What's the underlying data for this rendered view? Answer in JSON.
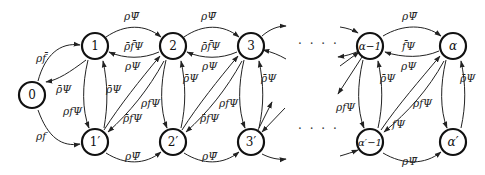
{
  "diagram": {
    "type": "state-transition",
    "nodes": {
      "n0": "0",
      "n1": "1",
      "n2": "2",
      "n3": "3",
      "nam1": "α−1",
      "na": "α",
      "n1p": "1′",
      "n2p": "2′",
      "n3p": "3′",
      "nam1p": "α′−1",
      "nap": "α′"
    },
    "ellipsis": "· · · ·",
    "labels": {
      "l0_1": "ρf̄",
      "l1_0": "ρ̄Ψ",
      "l0_1p": "ρf",
      "l1_1p": "ρfΨ",
      "l1p_1": "ρ̄Ψ",
      "l1_2": "ρΨ̄",
      "l2_1": "ρ̄f̄Ψ",
      "l1p_2": "ρΨ",
      "l2_1p": "ρ̄fΨ",
      "l1p_2p": "ρΨ̄",
      "l2_2p": "ρfΨ",
      "l2p_2": "ρ̄Ψ",
      "l2_3": "ρΨ̄",
      "l3_2": "ρ̄f̄Ψ",
      "l2p_3": "ρΨ",
      "l3_2p": "ρ̄fΨ",
      "l2p_3p": "ρΨ̄",
      "l3_3p": "ρfΨ",
      "l3p_3": "ρ̄Ψ",
      "lam1_a": "ρΨ̄",
      "la_am1": "f̄Ψ",
      "lam1p_a": "ρΨ",
      "la_am1p": "fΨ",
      "lam1p_ap": "ρΨ̄",
      "lam1_am1p": "ρfΨ",
      "lam1p_am1": "ρ̄Ψ",
      "la_ap": "ρfΨ",
      "lap_a": "ρ̄Ψ"
    }
  }
}
